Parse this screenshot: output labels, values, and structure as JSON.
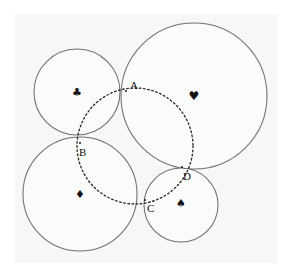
{
  "figure": {
    "width": 291,
    "height": 277,
    "background_color": "#ffffff",
    "plate_color": "#f7f7f7",
    "solid_stroke_color": "#6f6f74",
    "solid_fill_color": "#fbfbfb",
    "dotted_stroke_color": "#2b2b2b",
    "label_color": "#111111"
  },
  "plate": {
    "x": 15,
    "y": 14,
    "width": 262,
    "height": 249
  },
  "circles": [
    {
      "id": "club-circle",
      "suit": "club",
      "glyph": "♣",
      "cx": 77,
      "cy": 92,
      "r": 43,
      "glyph_size": 11,
      "glyph_x": 77,
      "glyph_y": 92
    },
    {
      "id": "heart-circle",
      "suit": "heart",
      "glyph": "♥",
      "cx": 194,
      "cy": 96,
      "r": 73,
      "glyph_size": 12,
      "glyph_x": 194,
      "glyph_y": 96
    },
    {
      "id": "diamond-circle",
      "suit": "diamond",
      "glyph": "♦",
      "cx": 80,
      "cy": 194,
      "r": 57,
      "glyph_size": 11,
      "glyph_x": 80,
      "glyph_y": 194
    },
    {
      "id": "spade-circle",
      "suit": "spade",
      "glyph": "♠",
      "cx": 181,
      "cy": 205,
      "r": 37,
      "glyph_size": 11,
      "glyph_x": 181,
      "glyph_y": 203
    }
  ],
  "dotted_circle": {
    "id": "inner-dotted-circle",
    "cx": 135,
    "cy": 146,
    "r": 58
  },
  "points": [
    {
      "id": "point-a",
      "label": "A",
      "x": 126,
      "y": 91,
      "label_x": 130,
      "label_y": 89
    },
    {
      "id": "point-b",
      "label": "B",
      "x": 80,
      "y": 143,
      "label_x": 79,
      "label_y": 156
    },
    {
      "id": "point-c",
      "label": "C",
      "x": 145,
      "y": 200,
      "label_x": 147,
      "label_y": 212
    },
    {
      "id": "point-d",
      "label": "D",
      "x": 182,
      "y": 167,
      "label_x": 183,
      "label_y": 180
    }
  ]
}
